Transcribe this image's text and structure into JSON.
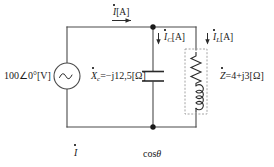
{
  "diagram": {
    "stroke_color": "#4a4a4a",
    "text_color": "#1a1a1a",
    "dashed_box_color": "#9a9a9a"
  },
  "source": {
    "name": "ac-voltage-source",
    "label": "100∠0°[V]",
    "symbol": "sine-wave"
  },
  "capacitor_branch": {
    "name": "capacitor",
    "label_prefix": "X",
    "label_subscript": "c",
    "label_value": "=−j12,5[Ω]",
    "label_full": "Ẋc=−j12,5[Ω]",
    "current_prefix": "I",
    "current_subscript": "C",
    "current_unit": "[A]",
    "current_full": "İC[A]"
  },
  "impedance_branch": {
    "name": "load-impedance",
    "label_prefix": "Z",
    "label_value": "=4+j3[Ω]",
    "label_full": "Ż=4+j3[Ω]",
    "current_prefix": "I",
    "current_subscript": "L",
    "current_unit": "[A]",
    "current_full": "İL[A]",
    "elements": [
      "resistor",
      "inductor"
    ]
  },
  "total_current": {
    "name": "total-current",
    "prefix": "I",
    "unit": "[A]",
    "full": "İ[A]"
  },
  "annotations": {
    "bottom_left": "İ",
    "bottom_left_prefix": "I",
    "bottom_center": "cosθ",
    "bottom_center_fn": "cos",
    "bottom_center_var": "θ"
  }
}
